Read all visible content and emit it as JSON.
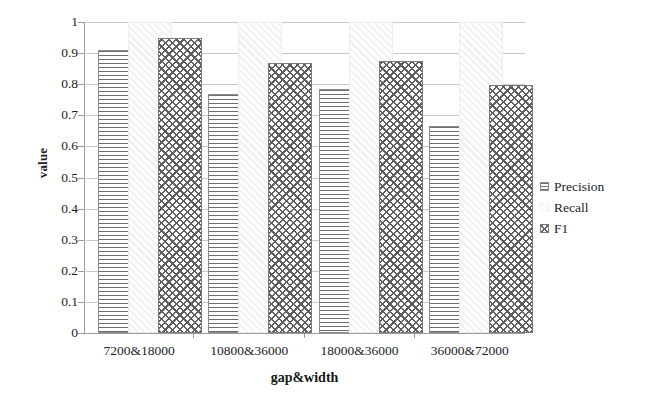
{
  "chart_data": {
    "type": "bar",
    "title": "",
    "xlabel": "gap&width",
    "ylabel": "value",
    "categories": [
      "7200&18000",
      "10800&36000",
      "18000&36000",
      "36000&72000"
    ],
    "series": [
      {
        "name": "Precision",
        "values": [
          0.91,
          0.77,
          0.785,
          0.665
        ]
      },
      {
        "name": "Recall",
        "values": [
          1.0,
          1.0,
          1.0,
          1.0
        ]
      },
      {
        "name": "F1",
        "values": [
          0.95,
          0.868,
          0.875,
          0.796
        ]
      }
    ],
    "ylim": [
      0,
      1
    ],
    "yticks": [
      "0",
      "0.1",
      "0.2",
      "0.3",
      "0.4",
      "0.5",
      "0.6",
      "0.7",
      "0.8",
      "0.9",
      "1"
    ],
    "ytick_values": [
      0,
      0.1,
      0.2,
      0.3,
      0.4,
      0.5,
      0.6,
      0.7,
      0.8,
      0.9,
      1
    ],
    "grid": true,
    "legend_position": "right",
    "legend": [
      "Precision",
      "Recall",
      "F1"
    ]
  },
  "legend": {
    "items": [
      {
        "label": "Precision",
        "swatch": "horizontal-hatch-swatch"
      },
      {
        "label": "Recall",
        "swatch": "blank-swatch"
      },
      {
        "label": "F1",
        "swatch": "crosshatch-swatch"
      }
    ]
  }
}
